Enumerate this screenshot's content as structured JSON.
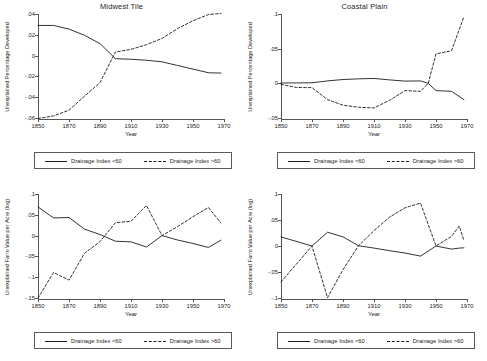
{
  "figure": {
    "xlabel": "Year",
    "legend": {
      "solid_label": "Drainage Index <60",
      "dashed_label": "Drainage Index >60"
    }
  },
  "chart_data": [
    {
      "type": "line",
      "panel": "top-left",
      "title": "Midwest Tile",
      "xlabel": "Year",
      "ylabel": "Unexplained Percentage Developed",
      "xlim": [
        1850,
        1970
      ],
      "ylim": [
        -0.06,
        0.04
      ],
      "xticks": [
        1850,
        1870,
        1890,
        1910,
        1930,
        1950,
        1970
      ],
      "xticklabels": [
        "1850",
        "1870",
        "1890",
        "1910",
        "1930",
        "1950",
        "1970"
      ],
      "yticks": [
        0.04,
        0.02,
        0,
        -0.02,
        -0.04,
        -0.06
      ],
      "yticklabels": [
        ".04",
        ".02",
        "0",
        "-.02",
        "-.04",
        "-.06"
      ],
      "grid": false,
      "legend_position": "below",
      "series": [
        {
          "name": "Drainage Index <60",
          "style": "solid",
          "x": [
            1850,
            1860,
            1870,
            1880,
            1890,
            1900,
            1910,
            1920,
            1930,
            1940,
            1950,
            1960,
            1968
          ],
          "values": [
            0.029,
            0.029,
            0.0255,
            0.0195,
            0.0115,
            -0.003,
            -0.0035,
            -0.0045,
            -0.006,
            -0.0095,
            -0.013,
            -0.0165,
            -0.0168
          ]
        },
        {
          "name": "Drainage Index >60",
          "style": "dashed",
          "x": [
            1850,
            1860,
            1870,
            1880,
            1890,
            1900,
            1910,
            1920,
            1930,
            1940,
            1950,
            1960,
            1968
          ],
          "values": [
            -0.0605,
            -0.058,
            -0.0525,
            -0.039,
            -0.026,
            0.0035,
            0.006,
            0.0105,
            0.0165,
            0.026,
            0.0335,
            0.0395,
            0.0405
          ]
        }
      ]
    },
    {
      "type": "line",
      "panel": "top-right",
      "title": "Coastal Plain",
      "xlabel": "Year",
      "ylabel": "Unexplained Percentage Developed",
      "xlim": [
        1850,
        1970
      ],
      "ylim": [
        -0.05,
        0.1
      ],
      "xticks": [
        1850,
        1870,
        1890,
        1910,
        1930,
        1950,
        1970
      ],
      "xticklabels": [
        "1850",
        "1870",
        "1890",
        "1910",
        "1930",
        "1950",
        "1970"
      ],
      "yticks": [
        0.1,
        0.05,
        0,
        -0.05
      ],
      "yticklabels": [
        ".1",
        ".05",
        "0",
        "-.05"
      ],
      "grid": false,
      "legend_position": "below",
      "series": [
        {
          "name": "Drainage Index <60",
          "style": "solid",
          "x": [
            1850,
            1860,
            1870,
            1880,
            1890,
            1900,
            1910,
            1920,
            1930,
            1940,
            1945,
            1950,
            1960,
            1968
          ],
          "values": [
            0.0005,
            0.0006,
            0.0008,
            0.0035,
            0.0055,
            0.0065,
            0.007,
            0.005,
            0.0032,
            0.0035,
            0.0,
            -0.0105,
            -0.0115,
            -0.0235
          ]
        },
        {
          "name": "Drainage Index >60",
          "style": "dashed",
          "x": [
            1850,
            1860,
            1870,
            1880,
            1890,
            1900,
            1910,
            1920,
            1930,
            1940,
            1945,
            1950,
            1960,
            1968
          ],
          "values": [
            -0.0015,
            -0.006,
            -0.0062,
            -0.0235,
            -0.0315,
            -0.0345,
            -0.0355,
            -0.0245,
            -0.0105,
            -0.0115,
            0.0,
            0.0425,
            0.047,
            0.096
          ]
        }
      ]
    },
    {
      "type": "line",
      "panel": "bottom-left",
      "title": "Midwest Tile",
      "xlabel": "Year",
      "ylabel": "Unexplained Farm Value per Acre (log)",
      "xlim": [
        1850,
        1970
      ],
      "ylim": [
        -0.15,
        0.1
      ],
      "xticks": [
        1850,
        1870,
        1890,
        1910,
        1930,
        1950,
        1970
      ],
      "xticklabels": [
        "1850",
        "1870",
        "1890",
        "1910",
        "1930",
        "1950",
        "1970"
      ],
      "yticks": [
        0.1,
        0.05,
        0,
        -0.05,
        -0.1,
        -0.15
      ],
      "yticklabels": [
        ".1",
        ".05",
        "0",
        "-.05",
        "-.1",
        "-.15"
      ],
      "grid": false,
      "legend_position": "below",
      "series": [
        {
          "name": "Drainage Index <60",
          "style": "solid",
          "x": [
            1850,
            1860,
            1870,
            1880,
            1890,
            1900,
            1910,
            1920,
            1930,
            1940,
            1950,
            1960,
            1968
          ],
          "values": [
            0.069,
            0.0425,
            0.0435,
            0.0155,
            0.0025,
            -0.0135,
            -0.015,
            -0.0275,
            0.0,
            -0.0105,
            -0.019,
            -0.0285,
            -0.011
          ]
        },
        {
          "name": "Drainage Index >60",
          "style": "dashed",
          "x": [
            1850,
            1860,
            1870,
            1880,
            1890,
            1900,
            1910,
            1920,
            1930,
            1940,
            1950,
            1960,
            1968
          ],
          "values": [
            -0.1505,
            -0.0885,
            -0.107,
            -0.0425,
            -0.0145,
            0.031,
            0.0345,
            0.0725,
            0.0,
            0.0215,
            0.0455,
            0.0675,
            0.0305
          ]
        }
      ]
    },
    {
      "type": "line",
      "panel": "bottom-right",
      "title": "Coastal Plain",
      "xlabel": "Year",
      "ylabel": "Unexplained Farm Value per Acre (log)",
      "xlim": [
        1850,
        1970
      ],
      "ylim": [
        -0.1,
        0.1
      ],
      "xticks": [
        1850,
        1870,
        1890,
        1910,
        1930,
        1950,
        1970
      ],
      "xticklabels": [
        "1850",
        "1870",
        "1890",
        "1910",
        "1930",
        "1950",
        "1970"
      ],
      "yticks": [
        0.1,
        0.05,
        0,
        -0.05,
        -0.1
      ],
      "yticklabels": [
        ".1",
        ".05",
        "0",
        "-.05",
        "-.1"
      ],
      "grid": false,
      "legend_position": "below",
      "series": [
        {
          "name": "Drainage Index <60",
          "style": "solid",
          "x": [
            1850,
            1870,
            1880,
            1890,
            1900,
            1910,
            1920,
            1930,
            1940,
            1950,
            1960,
            1965,
            1968
          ],
          "values": [
            0.0175,
            0.0,
            0.0265,
            0.0175,
            0.0005,
            -0.004,
            -0.009,
            -0.0135,
            -0.0195,
            0.0,
            -0.006,
            -0.004,
            -0.0035
          ]
        },
        {
          "name": "Drainage Index >60",
          "style": "dashed",
          "x": [
            1850,
            1870,
            1880,
            1890,
            1900,
            1910,
            1920,
            1930,
            1940,
            1950,
            1960,
            1965,
            1968
          ],
          "values": [
            -0.069,
            0.0,
            -0.0995,
            -0.0455,
            0.0005,
            0.0295,
            0.0555,
            0.0735,
            0.0825,
            0.0,
            0.0185,
            0.0385,
            0.0105
          ]
        }
      ]
    }
  ]
}
